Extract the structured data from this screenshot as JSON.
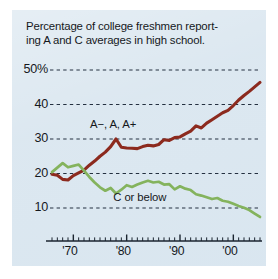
{
  "figure": {
    "panel_bg": "#dbe7f0",
    "page_bg": "#ffffff",
    "title_line1": "Percentage of college freshmen report-",
    "title_line2": "ing A and C averages in high school."
  },
  "chart_data": {
    "type": "line",
    "xlabel": "",
    "ylabel": "",
    "xlim": [
      1966,
      2005
    ],
    "ylim": [
      5,
      52
    ],
    "grid": true,
    "grid_style": "dashed-horizontal",
    "legend": "inline-annotations",
    "ytick_labels": [
      "50%",
      "40",
      "30",
      "20",
      "10"
    ],
    "ytick_values": [
      50,
      40,
      30,
      20,
      10
    ],
    "xtick_labels": [
      "'70",
      "'80",
      "'90",
      "'00"
    ],
    "xtick_values": [
      1970,
      1980,
      1990,
      2000
    ],
    "x_minor_tick_interval": 1,
    "x": [
      1966,
      1967,
      1968,
      1969,
      1970,
      1971,
      1972,
      1973,
      1974,
      1975,
      1976,
      1977,
      1978,
      1979,
      1980,
      1981,
      1982,
      1983,
      1984,
      1985,
      1986,
      1987,
      1988,
      1989,
      1990,
      1991,
      1992,
      1993,
      1994,
      1995,
      1996,
      1997,
      1998,
      1999,
      2000,
      2001,
      2002,
      2003,
      2004,
      2005
    ],
    "series": [
      {
        "name": "A−, A, A+",
        "color": "#8c2a1e",
        "label_x": 1978,
        "label_y": 34,
        "values": [
          19.8,
          19.5,
          18.3,
          18.1,
          19.4,
          20.2,
          21.0,
          22.4,
          23.6,
          25.0,
          26.2,
          27.8,
          30.0,
          27.6,
          27.4,
          27.3,
          27.2,
          27.8,
          28.2,
          28.0,
          28.4,
          29.8,
          29.6,
          30.4,
          30.6,
          31.5,
          32.3,
          33.8,
          33.2,
          34.6,
          35.6,
          36.6,
          37.6,
          38.3,
          39.7,
          41.3,
          42.6,
          43.8,
          45.1,
          46.4
        ]
      },
      {
        "name": "C or below",
        "color": "#84b35d",
        "label_x": 1982,
        "label_y": 13,
        "values": [
          20.4,
          21.7,
          23.0,
          21.8,
          22.2,
          22.6,
          20.8,
          19.0,
          17.4,
          16.0,
          15.0,
          15.8,
          14.2,
          15.3,
          16.6,
          16.1,
          16.8,
          17.4,
          17.9,
          17.4,
          17.6,
          16.8,
          16.9,
          15.4,
          16.3,
          15.6,
          15.2,
          14.0,
          13.6,
          13.1,
          12.6,
          12.9,
          12.1,
          11.8,
          11.2,
          10.6,
          10.1,
          9.4,
          8.4,
          7.4
        ]
      }
    ]
  }
}
